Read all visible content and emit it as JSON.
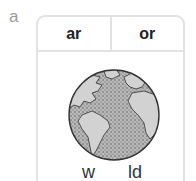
{
  "question_label": "a",
  "header": {
    "cells": [
      "ar",
      "or"
    ]
  },
  "image": {
    "icon": "globe-icon",
    "description": "Earth globe showing the Americas, Europe and Africa with stippled ocean"
  },
  "word_parts": {
    "left": "w",
    "right": "ld"
  },
  "colors": {
    "border": "#e2e2e2",
    "label": "#9a9a9a",
    "text": "#222222",
    "land": "#d0d0d0",
    "ocean": "#a8a8a8"
  }
}
